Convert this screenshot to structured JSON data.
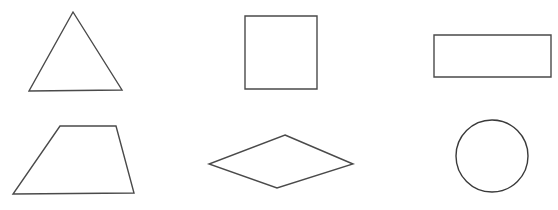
{
  "canvas": {
    "width": 558,
    "height": 210,
    "background_color": "#ffffff",
    "stroke_color": "#4a4a4a",
    "stroke_color_dark": "#3a3a3a",
    "stroke_width": 1.4
  },
  "diagram": {
    "type": "geometric-shapes-grid",
    "rows": 2,
    "columns": 3,
    "shape_count": 6
  },
  "shapes": [
    {
      "id": "triangle",
      "name": "triangle",
      "row": 1,
      "column": 1,
      "geometry": "polygon",
      "points": "73,12 122,90 29,91",
      "vertex_count": 3,
      "bbox": {
        "x": 29,
        "y": 12,
        "width": 93,
        "height": 79
      }
    },
    {
      "id": "square",
      "name": "square",
      "row": 1,
      "column": 2,
      "geometry": "polygon",
      "points": "245,16 317,16 317,89 245,89",
      "vertex_count": 4,
      "bbox": {
        "x": 245,
        "y": 16,
        "width": 72,
        "height": 73
      }
    },
    {
      "id": "rectangle",
      "name": "rectangle",
      "row": 1,
      "column": 3,
      "geometry": "polygon",
      "points": "434,35 551,35 551,77 434,77",
      "vertex_count": 4,
      "bbox": {
        "x": 434,
        "y": 35,
        "width": 117,
        "height": 42
      }
    },
    {
      "id": "trapezoid",
      "name": "trapezoid",
      "row": 2,
      "column": 1,
      "geometry": "polygon",
      "points": "60,126 116,126 134,193 13,194",
      "vertex_count": 4,
      "bbox": {
        "x": 13,
        "y": 126,
        "width": 121,
        "height": 68
      }
    },
    {
      "id": "rhombus",
      "name": "rhombus",
      "row": 2,
      "column": 2,
      "geometry": "polygon",
      "points": "285,135 353,164 277,188 209,164",
      "vertex_count": 4,
      "bbox": {
        "x": 209,
        "y": 135,
        "width": 144,
        "height": 53
      }
    },
    {
      "id": "circle",
      "name": "circle",
      "row": 2,
      "column": 3,
      "geometry": "ellipse",
      "center_x": 492,
      "center_y": 156,
      "radius_x": 36,
      "radius_y": 36,
      "bbox": {
        "x": 456,
        "y": 120,
        "width": 72,
        "height": 72
      }
    }
  ]
}
